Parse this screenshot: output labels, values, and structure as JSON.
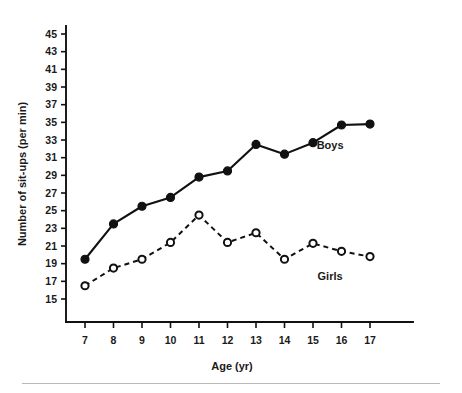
{
  "chart_data": {
    "type": "line",
    "title": "",
    "xlabel": "Age (yr)",
    "ylabel": "Number of sit-ups (per min)",
    "x": [
      7,
      8,
      9,
      10,
      11,
      12,
      13,
      14,
      15,
      16,
      17
    ],
    "xtick_labels": [
      "7",
      "8",
      "9",
      "10",
      "11",
      "12",
      "13",
      "14",
      "15",
      "16",
      "17"
    ],
    "ytick_labels": [
      "15",
      "17",
      "19",
      "21",
      "23",
      "25",
      "27",
      "29",
      "31",
      "33",
      "35",
      "37",
      "39",
      "41",
      "43",
      "45"
    ],
    "yticks": [
      15,
      17,
      19,
      21,
      23,
      25,
      27,
      29,
      31,
      33,
      35,
      37,
      39,
      41,
      43,
      45
    ],
    "xlim": [
      6.4,
      17.6
    ],
    "ylim": [
      14.1,
      46.2
    ],
    "grid": false,
    "legend_position": "inline-annotation",
    "series": [
      {
        "name": "Boys",
        "label": "Boys",
        "marker": "filled-circle",
        "linestyle": "solid",
        "color": "#111111",
        "values": [
          19.5,
          23.5,
          25.5,
          26.5,
          28.8,
          29.5,
          32.5,
          31.4,
          32.7,
          34.7,
          34.8
        ],
        "annotation": {
          "text": "Boys",
          "x": 15.6,
          "y": 32.0
        }
      },
      {
        "name": "Girls",
        "label": "Girls",
        "marker": "open-circle",
        "linestyle": "dashed",
        "color": "#111111",
        "values": [
          16.5,
          18.5,
          19.5,
          21.4,
          24.5,
          21.4,
          22.5,
          19.5,
          21.3,
          20.4,
          19.8
        ],
        "annotation": {
          "text": "Girls",
          "x": 15.6,
          "y": 17.2
        }
      }
    ]
  },
  "figure": {
    "background_color": "#ffffff",
    "axis_color": "#111111",
    "footer_rule_color": "#b9b9b9"
  }
}
